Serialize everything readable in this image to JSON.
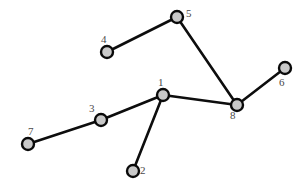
{
  "diagram": {
    "background_color": "#ffffff",
    "node_fill_color": "#c9c9c9",
    "node_stroke_color": "#0a0a0a",
    "edge_color": "#0d0d0d",
    "label_color": "#4a4a4a",
    "node_radius": 6,
    "nodes": [
      {
        "id": "1",
        "label": "1",
        "x": 163,
        "y": 95,
        "label_x": 158,
        "label_y": 77
      },
      {
        "id": "2",
        "label": "2",
        "x": 133,
        "y": 171,
        "label_x": 140,
        "label_y": 165
      },
      {
        "id": "3",
        "label": "3",
        "x": 101,
        "y": 120,
        "label_x": 89,
        "label_y": 103
      },
      {
        "id": "4",
        "label": "4",
        "x": 107,
        "y": 52,
        "label_x": 101,
        "label_y": 34
      },
      {
        "id": "5",
        "label": "5",
        "x": 177,
        "y": 17,
        "label_x": 186,
        "label_y": 8
      },
      {
        "id": "6",
        "label": "6",
        "x": 285,
        "y": 68,
        "label_x": 279,
        "label_y": 77
      },
      {
        "id": "7",
        "label": "7",
        "x": 28,
        "y": 144,
        "label_x": 28,
        "label_y": 126
      },
      {
        "id": "8",
        "label": "8",
        "x": 237,
        "y": 105,
        "label_x": 230,
        "label_y": 110
      }
    ],
    "edges": [
      {
        "from": "4",
        "to": "5",
        "x1": 107,
        "y1": 52,
        "x2": 177,
        "y2": 17
      },
      {
        "from": "5",
        "to": "8",
        "x1": 177,
        "y1": 17,
        "x2": 237,
        "y2": 105
      },
      {
        "from": "6",
        "to": "8",
        "x1": 285,
        "y1": 68,
        "x2": 237,
        "y2": 105
      },
      {
        "from": "1",
        "to": "8",
        "x1": 163,
        "y1": 95,
        "x2": 237,
        "y2": 105
      },
      {
        "from": "1",
        "to": "3",
        "x1": 163,
        "y1": 95,
        "x2": 101,
        "y2": 120
      },
      {
        "from": "1",
        "to": "2",
        "x1": 163,
        "y1": 95,
        "x2": 133,
        "y2": 171
      },
      {
        "from": "3",
        "to": "7",
        "x1": 101,
        "y1": 120,
        "x2": 28,
        "y2": 144
      }
    ]
  }
}
